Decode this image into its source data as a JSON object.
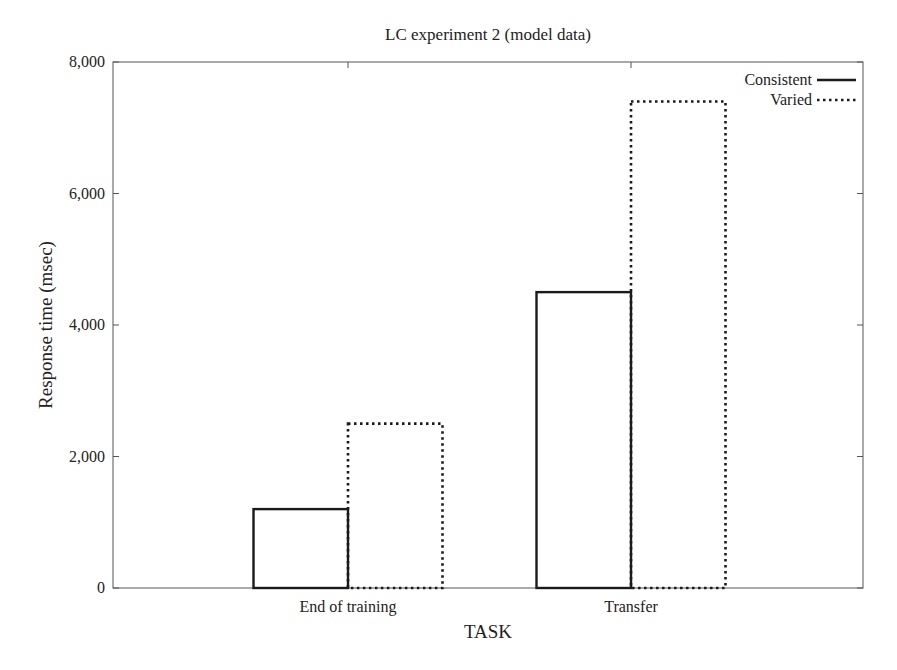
{
  "chart_data": {
    "type": "bar",
    "title": "LC experiment 2 (model data)",
    "xlabel": "TASK",
    "ylabel": "Response time (msec)",
    "ylim": [
      0,
      8000
    ],
    "yticks": [
      0,
      2000,
      4000,
      6000,
      8000
    ],
    "ytick_labels": [
      "0",
      "2,000",
      "4,000",
      "6,000",
      "8,000"
    ],
    "categories": [
      "End of training",
      "Transfer"
    ],
    "series": [
      {
        "name": "Consistent",
        "line_style": "solid",
        "values": [
          1200,
          4500
        ]
      },
      {
        "name": "Varied",
        "line_style": "dotted",
        "values": [
          2500,
          7400
        ]
      }
    ],
    "grid": false,
    "legend_position": "top-right"
  }
}
